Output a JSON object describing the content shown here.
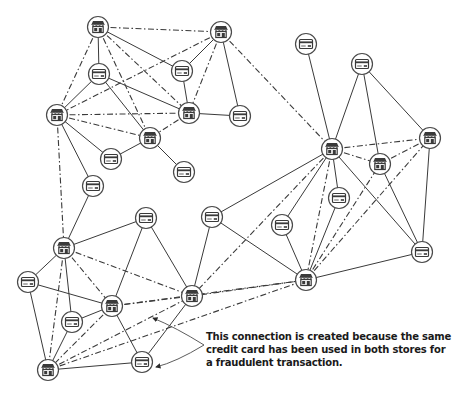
{
  "diagram": {
    "type": "fraud-detection-graph",
    "colors": {
      "stroke": "#3a3a3a",
      "node_fill": "#ffffff",
      "text": "#1a1a1a"
    },
    "legend": {
      "solid_edge": "transaction (card used at store)",
      "dashed_edge": "derived store-to-store connection"
    },
    "nodes": [
      {
        "id": "S1",
        "kind": "store",
        "icon": "store-icon",
        "x": 98,
        "y": 27
      },
      {
        "id": "S13",
        "kind": "store",
        "icon": "store-icon",
        "x": 221,
        "y": 32
      },
      {
        "id": "C15",
        "kind": "card",
        "icon": "credit-card-icon",
        "x": 306,
        "y": 44
      },
      {
        "id": "C16",
        "kind": "card",
        "icon": "credit-card-icon",
        "x": 362,
        "y": 64
      },
      {
        "id": "C1",
        "kind": "card",
        "icon": "credit-card-icon",
        "x": 99,
        "y": 74
      },
      {
        "id": "C2",
        "kind": "card",
        "icon": "credit-card-icon",
        "x": 182,
        "y": 71
      },
      {
        "id": "S2",
        "kind": "store",
        "icon": "store-icon",
        "x": 57,
        "y": 115
      },
      {
        "id": "S3",
        "kind": "store",
        "icon": "store-icon",
        "x": 189,
        "y": 113
      },
      {
        "id": "C3",
        "kind": "card",
        "icon": "credit-card-icon",
        "x": 240,
        "y": 116
      },
      {
        "id": "S4",
        "kind": "store",
        "icon": "store-icon",
        "x": 150,
        "y": 138
      },
      {
        "id": "C5",
        "kind": "card",
        "icon": "credit-card-icon",
        "x": 111,
        "y": 159
      },
      {
        "id": "C4",
        "kind": "card",
        "icon": "credit-card-icon",
        "x": 184,
        "y": 172
      },
      {
        "id": "S10",
        "kind": "store",
        "icon": "store-icon",
        "x": 332,
        "y": 149
      },
      {
        "id": "S12",
        "kind": "store",
        "icon": "store-icon",
        "x": 430,
        "y": 138
      },
      {
        "id": "S11",
        "kind": "store",
        "icon": "store-icon",
        "x": 380,
        "y": 164
      },
      {
        "id": "C6",
        "kind": "card",
        "icon": "credit-card-icon",
        "x": 93,
        "y": 186
      },
      {
        "id": "C13",
        "kind": "card",
        "icon": "credit-card-icon",
        "x": 339,
        "y": 198
      },
      {
        "id": "C11",
        "kind": "card",
        "icon": "credit-card-icon",
        "x": 212,
        "y": 217
      },
      {
        "id": "C7",
        "kind": "card",
        "icon": "credit-card-icon",
        "x": 146,
        "y": 218
      },
      {
        "id": "C12",
        "kind": "card",
        "icon": "credit-card-icon",
        "x": 282,
        "y": 225
      },
      {
        "id": "S5",
        "kind": "store",
        "icon": "store-icon",
        "x": 64,
        "y": 248
      },
      {
        "id": "C14",
        "kind": "card",
        "icon": "credit-card-icon",
        "x": 422,
        "y": 252
      },
      {
        "id": "S9",
        "kind": "store",
        "icon": "store-icon",
        "x": 306,
        "y": 280
      },
      {
        "id": "C8",
        "kind": "card",
        "icon": "credit-card-icon",
        "x": 28,
        "y": 282
      },
      {
        "id": "S8",
        "kind": "store",
        "icon": "store-icon",
        "x": 192,
        "y": 296
      },
      {
        "id": "S6",
        "kind": "store",
        "icon": "store-icon",
        "x": 112,
        "y": 306
      },
      {
        "id": "C9",
        "kind": "card",
        "icon": "credit-card-icon",
        "x": 72,
        "y": 322
      },
      {
        "id": "C10",
        "kind": "card",
        "icon": "credit-card-icon",
        "x": 142,
        "y": 362
      },
      {
        "id": "S7",
        "kind": "store",
        "icon": "store-icon",
        "x": 48,
        "y": 370
      }
    ],
    "edges": [
      [
        "S1",
        "C1",
        "solid"
      ],
      [
        "S1",
        "C2",
        "solid"
      ],
      [
        "S1",
        "S13",
        "dashed"
      ],
      [
        "S1",
        "S3",
        "dashed"
      ],
      [
        "S1",
        "S4",
        "dashed"
      ],
      [
        "S1",
        "S2",
        "dashed"
      ],
      [
        "C1",
        "S2",
        "solid"
      ],
      [
        "C1",
        "S3",
        "solid"
      ],
      [
        "C1",
        "S4",
        "solid"
      ],
      [
        "S13",
        "S2",
        "dashed"
      ],
      [
        "S13",
        "C2",
        "solid"
      ],
      [
        "S13",
        "S3",
        "dashed"
      ],
      [
        "S13",
        "C3",
        "solid"
      ],
      [
        "S13",
        "S10",
        "dashed"
      ],
      [
        "C2",
        "S3",
        "solid"
      ],
      [
        "S2",
        "S3",
        "dashed"
      ],
      [
        "S2",
        "S4",
        "dashed"
      ],
      [
        "S2",
        "C5",
        "solid"
      ],
      [
        "S2",
        "C6",
        "solid"
      ],
      [
        "S2",
        "S5",
        "dashed"
      ],
      [
        "S3",
        "S4",
        "dashed"
      ],
      [
        "S3",
        "C3",
        "solid"
      ],
      [
        "S4",
        "C5",
        "solid"
      ],
      [
        "S4",
        "C4",
        "solid"
      ],
      [
        "C6",
        "S5",
        "solid"
      ],
      [
        "S5",
        "C7",
        "solid"
      ],
      [
        "S5",
        "C8",
        "solid"
      ],
      [
        "S5",
        "S6",
        "dashed"
      ],
      [
        "S5",
        "S8",
        "dashed"
      ],
      [
        "S5",
        "C9",
        "solid"
      ],
      [
        "S5",
        "S7",
        "dashed"
      ],
      [
        "C8",
        "S6",
        "solid"
      ],
      [
        "C8",
        "S7",
        "solid"
      ],
      [
        "C9",
        "S6",
        "solid"
      ],
      [
        "C9",
        "S7",
        "solid"
      ],
      [
        "S6",
        "S7",
        "dashed"
      ],
      [
        "S6",
        "S8",
        "dashed"
      ],
      [
        "S6",
        "C10",
        "solid"
      ],
      [
        "S6",
        "C7",
        "solid"
      ],
      [
        "S7",
        "S8",
        "dashed"
      ],
      [
        "S7",
        "C10",
        "solid"
      ],
      [
        "S7",
        "S9",
        "dashed"
      ],
      [
        "C10",
        "S8",
        "solid"
      ],
      [
        "C7",
        "S8",
        "solid"
      ],
      [
        "S10",
        "C11",
        "solid"
      ],
      [
        "S10",
        "S8",
        "dashed"
      ],
      [
        "S10",
        "C12",
        "solid"
      ],
      [
        "S10",
        "S9",
        "dashed"
      ],
      [
        "S10",
        "C13",
        "solid"
      ],
      [
        "S10",
        "C14",
        "solid"
      ],
      [
        "S10",
        "S11",
        "dashed"
      ],
      [
        "S10",
        "S12",
        "dashed"
      ],
      [
        "S6",
        "S9",
        "dashed"
      ],
      [
        "C11",
        "S8",
        "solid"
      ],
      [
        "C11",
        "S9",
        "solid"
      ],
      [
        "C12",
        "S9",
        "solid"
      ],
      [
        "C13",
        "S9",
        "solid"
      ],
      [
        "S9",
        "S8",
        "dashed"
      ],
      [
        "S9",
        "S11",
        "dashed"
      ],
      [
        "S9",
        "S12",
        "dashed"
      ],
      [
        "S9",
        "C14",
        "solid"
      ],
      [
        "C15",
        "S10",
        "solid"
      ],
      [
        "C16",
        "S10",
        "solid"
      ],
      [
        "C16",
        "S11",
        "solid"
      ],
      [
        "C16",
        "S12",
        "solid"
      ],
      [
        "S11",
        "S12",
        "dashed"
      ],
      [
        "S12",
        "C14",
        "solid"
      ],
      [
        "S11",
        "C14",
        "solid"
      ]
    ],
    "annotation": {
      "lines": [
        "This connection is created because the same",
        "credit card has been used in both stores for",
        "a fraudulent transaction."
      ],
      "arrows": [
        {
          "from": [
            204,
            345
          ],
          "to": [
            153,
            318
          ]
        },
        {
          "from": [
            204,
            345
          ],
          "to": [
            156,
            367
          ]
        }
      ]
    }
  }
}
